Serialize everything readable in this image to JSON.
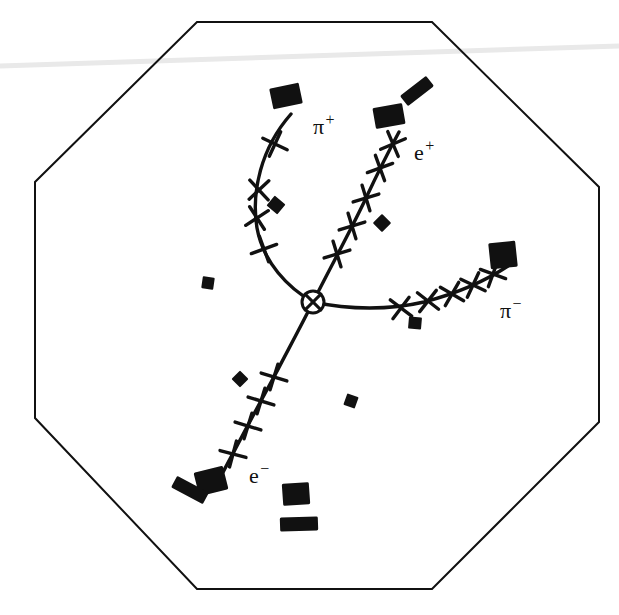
{
  "figure": {
    "kind": "particle-detector-event-display",
    "background_color": "#ffffff",
    "ink_color": "#111111",
    "width": 619,
    "height": 615
  },
  "detector": {
    "name": "octagonal-detector-outline",
    "shape": "octagon",
    "stroke_color": "#111111",
    "stroke_width": 2.0,
    "fill": "none",
    "vertices": [
      [
        197,
        22
      ],
      [
        432,
        22
      ],
      [
        599,
        187
      ],
      [
        599,
        422
      ],
      [
        432,
        589
      ],
      [
        197,
        589
      ],
      [
        35,
        418
      ],
      [
        35,
        182
      ]
    ]
  },
  "scan_artifact": {
    "name": "scan-streak",
    "color": "#e9e9e9",
    "path": "M 0,66 L 619,46",
    "stroke_width": 5
  },
  "vertex": {
    "name": "interaction-vertex",
    "marker": "crossed-circle",
    "x": 313,
    "y": 302,
    "radius": 11,
    "stroke_width": 3
  },
  "chart_data": {
    "type": "scatter",
    "title": "",
    "xlabel": "",
    "ylabel": "",
    "grid": false,
    "legend": "inline-track-labels",
    "xlim": [
      0,
      619
    ],
    "ylim": [
      0,
      615
    ],
    "note": "Four charged particle tracks emerging from a common interaction vertex inside an octagonal tracking detector. Crosses mark tracking-chamber hits; filled blocks mark calorimeter energy deposits.",
    "vertex": [
      313,
      302
    ],
    "series": [
      {
        "name": "pi-plus-track",
        "label": "π",
        "charge": "+",
        "curvature": "curves left (clockwise)",
        "path": "M 313,302 C 288,288 263,262 257,228 C 251,192 261,148 291,114",
        "hit_count": 4,
        "hits": [
          [
            264,
            249
          ],
          [
            257,
            218
          ],
          [
            259,
            190
          ],
          [
            275,
            144
          ]
        ],
        "hit_angles": [
          205,
          192,
          182,
          160
        ],
        "endpoint": [
          291,
          114
        ]
      },
      {
        "name": "e-plus-track",
        "label": "e",
        "charge": "+",
        "curvature": "nearly straight",
        "path": "M 313,302 C 330,268 350,232 366,198 C 381,166 392,145 399,132",
        "hit_count": 5,
        "hits": [
          [
            337,
            254
          ],
          [
            352,
            226
          ],
          [
            366,
            198
          ],
          [
            380,
            168
          ],
          [
            393,
            144
          ]
        ],
        "hit_angles": [
          118,
          118,
          118,
          115,
          112
        ],
        "endpoint": [
          399,
          132
        ]
      },
      {
        "name": "pi-minus-track",
        "label": "π",
        "charge": "−",
        "curvature": "curves slightly up to the right",
        "path": "M 313,302 C 350,310 390,310 424,302 C 462,292 490,278 508,266",
        "hit_count": 5,
        "hits": [
          [
            401,
            308
          ],
          [
            428,
            301
          ],
          [
            452,
            294
          ],
          [
            473,
            285
          ],
          [
            493,
            274
          ]
        ],
        "hit_angles": [
          82,
          83,
          75,
          70,
          65
        ],
        "endpoint": [
          508,
          266
        ]
      },
      {
        "name": "e-minus-track",
        "label": "e",
        "charge": "−",
        "curvature": "nearly straight",
        "path": "M 313,302 C 302,324 288,350 275,375 C 258,406 238,444 221,476",
        "hit_count": 4,
        "hits": [
          [
            274,
            377
          ],
          [
            261,
            401
          ],
          [
            248,
            426
          ],
          [
            233,
            454
          ]
        ],
        "hit_angles": [
          62,
          62,
          62,
          60
        ],
        "endpoint": [
          221,
          476
        ]
      }
    ]
  },
  "track_labels": [
    {
      "name": "track-label-pi-plus",
      "base": "π",
      "sup": "+",
      "x": 313,
      "y": 134,
      "font_size": 22,
      "sup_font_size": 16
    },
    {
      "name": "track-label-e-plus",
      "base": "e",
      "sup": "+",
      "x": 414,
      "y": 160,
      "font_size": 22,
      "sup_font_size": 16
    },
    {
      "name": "track-label-pi-minus",
      "base": "π",
      "sup": "−",
      "x": 500,
      "y": 318,
      "font_size": 22,
      "sup_font_size": 16
    },
    {
      "name": "track-label-e-minus",
      "base": "e",
      "sup": "−",
      "x": 249,
      "y": 483,
      "font_size": 22,
      "sup_font_size": 16
    }
  ],
  "calorimeter_blocks": [
    {
      "name": "calorimeter-block-pi-plus-end",
      "x": 286,
      "y": 96,
      "w": 30,
      "h": 21,
      "rot": -12
    },
    {
      "name": "calorimeter-block-e-plus-end",
      "x": 389,
      "y": 116,
      "w": 30,
      "h": 21,
      "rot": -10
    },
    {
      "name": "calorimeter-bar-upper-right",
      "x": 417,
      "y": 91,
      "w": 33,
      "h": 13,
      "rot": -38
    },
    {
      "name": "calorimeter-block-pi-minus-end",
      "x": 503,
      "y": 255,
      "w": 27,
      "h": 26,
      "rot": -6
    },
    {
      "name": "calorimeter-block-e-minus-end",
      "x": 211,
      "y": 481,
      "w": 30,
      "h": 24,
      "rot": -14
    },
    {
      "name": "calorimeter-bar-lower-left",
      "x": 190,
      "y": 490,
      "w": 36,
      "h": 13,
      "rot": 28
    },
    {
      "name": "calorimeter-block-bottom-center",
      "x": 296,
      "y": 494,
      "w": 27,
      "h": 22,
      "rot": -4
    },
    {
      "name": "calorimeter-bar-bottom-center",
      "x": 299,
      "y": 524,
      "w": 38,
      "h": 14,
      "rot": -2
    }
  ],
  "isolated_hits": [
    {
      "name": "isolated-hit-left-mid",
      "x": 208,
      "y": 283,
      "w": 12,
      "h": 12,
      "rot": 8
    },
    {
      "name": "isolated-hit-pi-plus-inner",
      "x": 276,
      "y": 205,
      "w": 14,
      "h": 13,
      "rot": 40
    },
    {
      "name": "isolated-hit-e-plus-right",
      "x": 382,
      "y": 223,
      "w": 13,
      "h": 13,
      "rot": 45
    },
    {
      "name": "isolated-hit-pi-minus-below",
      "x": 415,
      "y": 323,
      "w": 13,
      "h": 12,
      "rot": 5
    },
    {
      "name": "isolated-hit-e-minus-upper",
      "x": 240,
      "y": 379,
      "w": 12,
      "h": 12,
      "rot": 45
    },
    {
      "name": "isolated-hit-bottom-mid",
      "x": 351,
      "y": 401,
      "w": 12,
      "h": 12,
      "rot": 20
    }
  ]
}
